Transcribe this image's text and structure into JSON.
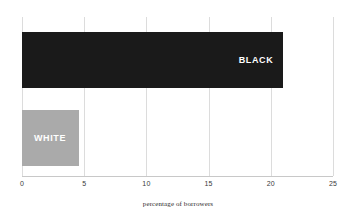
{
  "chart_data": {
    "type": "bar",
    "orientation": "horizontal",
    "title": "",
    "subtitle": "",
    "xlabel": "percentage of borrowers",
    "ylabel": "",
    "categories": [
      "BLACK",
      "WHITE"
    ],
    "values": [
      21.0,
      4.6
    ],
    "series": [
      {
        "name": "percentage of borrowers",
        "values": [
          21.0,
          4.6
        ]
      }
    ],
    "bars": [
      {
        "label": "BLACK",
        "value": 21.0,
        "color": "#1a1a1a",
        "label_color": "#ffffff",
        "label_position": "inside-right"
      },
      {
        "label": "WHITE",
        "value": 4.6,
        "color": "#aaaaaa",
        "label_color": "#ffffff",
        "label_position": "inside-left"
      }
    ],
    "xlim": [
      0,
      25
    ],
    "xticks": [
      0,
      5,
      10,
      15,
      20,
      25
    ],
    "xtick_labels": [
      "0",
      "5",
      "10",
      "15",
      "20",
      "25"
    ],
    "grid": "vertical",
    "legend": "none",
    "background_color": "#ffffff",
    "gridline_color": "#dcdcdc",
    "axis_color": "#c8c8c8"
  },
  "axis": {
    "title": "percentage of borrowers",
    "ticks": [
      {
        "label": "0",
        "value": 0
      },
      {
        "label": "5",
        "value": 5
      },
      {
        "label": "10",
        "value": 10
      },
      {
        "label": "15",
        "value": 15
      },
      {
        "label": "20",
        "value": 20
      },
      {
        "label": "25",
        "value": 25
      }
    ]
  }
}
